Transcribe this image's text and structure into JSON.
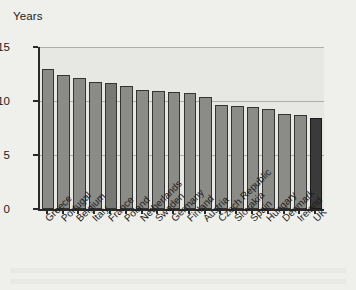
{
  "chart_data": {
    "type": "bar",
    "title": "",
    "xlabel": "",
    "ylabel": "Years",
    "ylim": [
      0,
      15
    ],
    "yticks": [
      0,
      5,
      10,
      15
    ],
    "grid": true,
    "legend": false,
    "categories": [
      "Greece",
      "Portugal",
      "Belgium",
      "Italy",
      "France",
      "Poland",
      "Netherlands",
      "Sweden",
      "Germany",
      "Finland",
      "Austria",
      "Czech Republic",
      "Slovakia",
      "Spain",
      "Hungary",
      "Denmark",
      "Ireland",
      "UK"
    ],
    "values": [
      13.0,
      12.4,
      12.1,
      11.8,
      11.7,
      11.4,
      11.0,
      10.9,
      10.8,
      10.7,
      10.4,
      9.6,
      9.5,
      9.4,
      9.3,
      8.8,
      8.7,
      8.4
    ],
    "bar_styles": [
      "normal",
      "normal",
      "normal",
      "normal",
      "mid",
      "normal",
      "normal",
      "normal",
      "normal",
      "normal",
      "normal",
      "normal",
      "normal",
      "normal",
      "normal",
      "normal",
      "normal",
      "dark"
    ],
    "colors": {
      "bar": "#8b8b88",
      "bar_mid": "#787875",
      "bar_highlight": "#3a3a3a",
      "bar_outline": "#343434",
      "axis": "#2a2a2a",
      "gridline": "#adadaa",
      "plot_background": "#e7e7e4",
      "page_background": "#efefec",
      "text": "#1c1c1c"
    }
  }
}
